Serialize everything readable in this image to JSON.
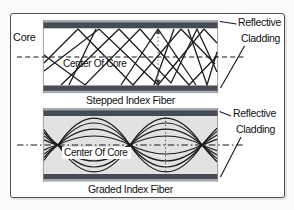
{
  "figure": {
    "stepped": {
      "core_label": "Core",
      "center_label": "Center Of Core",
      "reflective_label": "Reflective",
      "cladding_label": "Cladding",
      "caption": "Stepped Index Fiber"
    },
    "graded": {
      "center_label": "Center Of Core",
      "reflective_label": "Reflective",
      "cladding_label": "Cladding",
      "caption": "Graded Index Fiber"
    }
  },
  "colors": {
    "cladding-dark": "#474b54",
    "cladding-light": "#a9adb3",
    "core-graded-fill": "#e2e2e2",
    "ray": "#1c1c1c",
    "border": "#4f4f4f"
  }
}
